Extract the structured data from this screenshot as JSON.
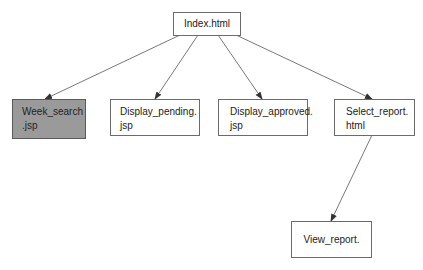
{
  "diagram": {
    "root": {
      "line1": "Index.html"
    },
    "children": [
      {
        "line1": "Week_search",
        "line2": ".jsp",
        "highlighted": true
      },
      {
        "line1": "Display_pending.",
        "line2": "jsp"
      },
      {
        "line1": "Display_approved.",
        "line2": "jsp"
      },
      {
        "line1": "Select_report.",
        "line2": "html"
      }
    ],
    "grandchild": {
      "line1": "View_report."
    },
    "colors": {
      "highlight_fill": "#9a9a9a",
      "border": "#6b6b6b",
      "edge": "#555555"
    }
  }
}
